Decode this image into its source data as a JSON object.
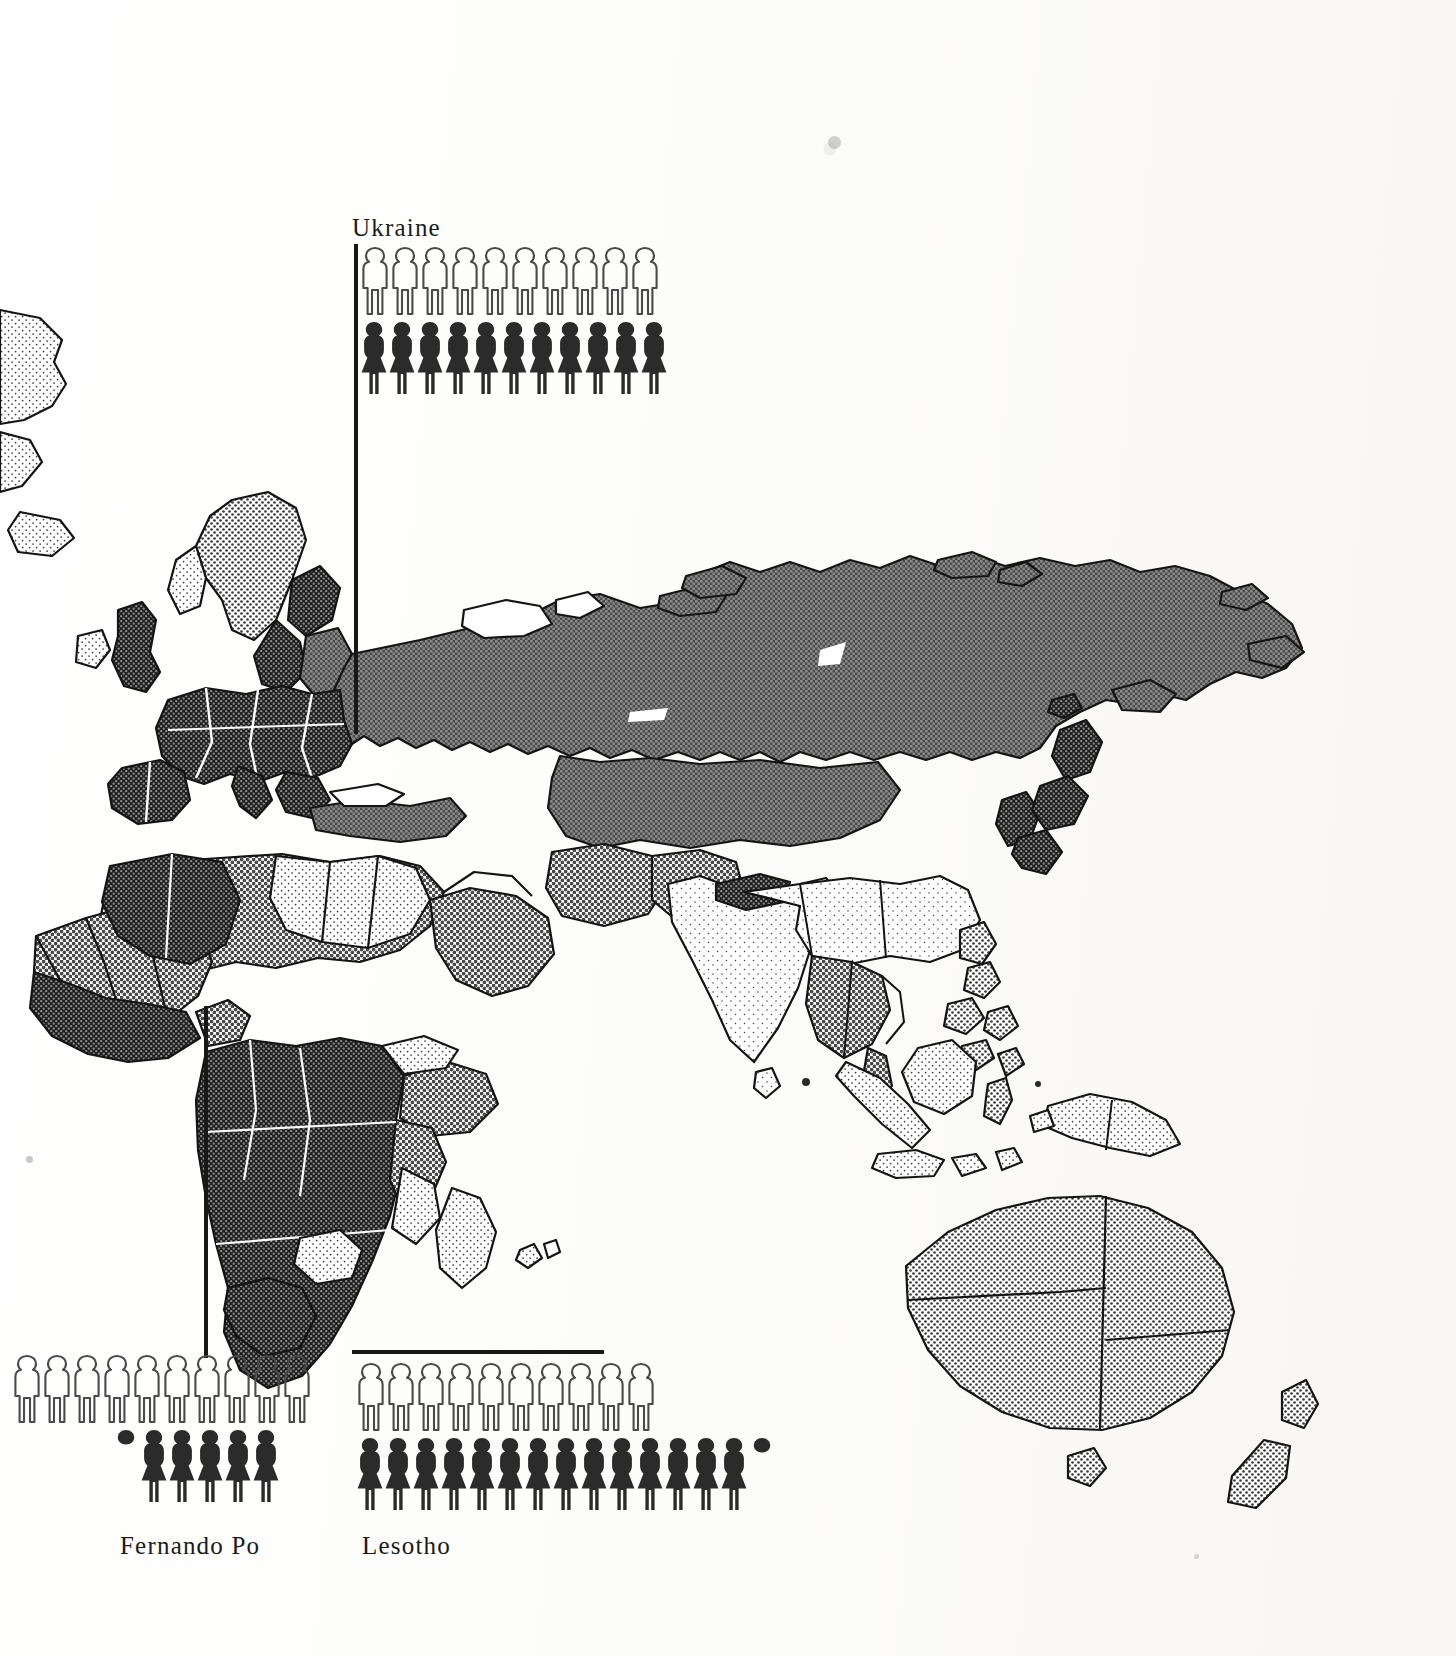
{
  "figure": {
    "type": "pictogram-map",
    "title": "",
    "regions_shown": [
      "Europe",
      "Asia",
      "Africa",
      "Australia",
      "New Zealand"
    ]
  },
  "frame": {
    "top_rule": true,
    "right_rule": true,
    "corner": "rounded-top-right",
    "color": "#1b1b1b"
  },
  "chart_data": {
    "type": "bar",
    "subtype": "pictogram",
    "title": "",
    "xlabel": "",
    "ylabel": "",
    "legend_position": "none",
    "symbol_meanings": {
      "outline_figure": "male",
      "filled_figure": "female",
      "partial_figure": "fraction of one unit"
    },
    "categories": [
      "Ukraine",
      "Fernando Po",
      "Lesotho"
    ],
    "series": [
      {
        "name": "male",
        "values": [
          10,
          10,
          10
        ]
      },
      {
        "name": "female",
        "values": [
          11,
          5.3,
          14.4
        ]
      }
    ]
  },
  "groups": [
    {
      "id": "ukraine",
      "label": "Ukraine",
      "male_full": 10,
      "male_partial": 0,
      "female_full": 11,
      "female_partial": 0,
      "leader_line": true
    },
    {
      "id": "fernando-po",
      "label": "Fernando Po",
      "male_full": 10,
      "male_partial": 0,
      "female_full": 5,
      "female_partial": 1,
      "leader_line": true
    },
    {
      "id": "lesotho",
      "label": "Lesotho",
      "male_full": 10,
      "male_partial": 0,
      "female_full": 14,
      "female_partial": 1,
      "leader_line": true
    }
  ],
  "colors": {
    "ink": "#1a1a1a",
    "paper": "#fbfaf8",
    "shade_dark": "#3a3a3a",
    "shade_mid": "#8d8d8d",
    "shade_light": "#d9d9d9",
    "outline": "#141414"
  }
}
